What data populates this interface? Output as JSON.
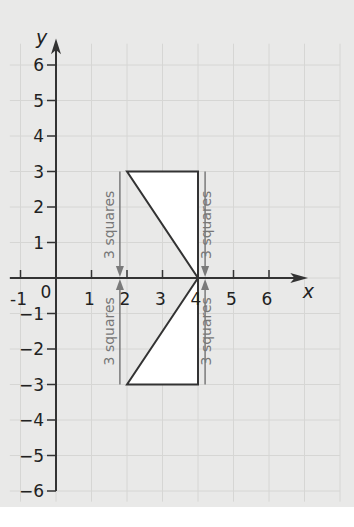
{
  "diagram": {
    "title": "",
    "x_axis": {
      "label": "x",
      "min": -1,
      "max": 6,
      "ticks": [
        -1,
        0,
        1,
        2,
        3,
        4,
        5,
        6
      ],
      "tick_labels": [
        "-1",
        "0",
        "1",
        "2",
        "3",
        "4",
        "5",
        "6"
      ]
    },
    "y_axis": {
      "label": "y",
      "min": -6,
      "max": 6,
      "ticks": [
        -6,
        -5,
        -4,
        -3,
        -2,
        -1,
        1,
        2,
        3,
        4,
        5,
        6
      ],
      "tick_labels": [
        "−6",
        "−5",
        "−4",
        "−3",
        "−2",
        "−1",
        "1",
        "2",
        "3",
        "4",
        "5",
        "6"
      ]
    },
    "shapes": [
      {
        "name": "triangle-upper",
        "vertices": [
          [
            2,
            3
          ],
          [
            4,
            3
          ],
          [
            4,
            0
          ]
        ],
        "fill": "#ffffff",
        "stroke": "#333333"
      },
      {
        "name": "triangle-lower",
        "vertices": [
          [
            2,
            -3
          ],
          [
            4,
            -3
          ],
          [
            4,
            0
          ]
        ],
        "fill": "#ffffff",
        "stroke": "#333333"
      }
    ],
    "measures": [
      {
        "name": "measure-left-upper",
        "x": 1.8,
        "from": 3,
        "to": 0,
        "label": "3 squares"
      },
      {
        "name": "measure-right-upper",
        "x": 4.2,
        "from": 3,
        "to": 0,
        "label": "3 squares"
      },
      {
        "name": "measure-left-lower",
        "x": 1.8,
        "from": -3,
        "to": 0,
        "label": "3 squares"
      },
      {
        "name": "measure-right-lower",
        "x": 4.2,
        "from": -3,
        "to": 0,
        "label": "3 squares"
      }
    ],
    "colors": {
      "axis": "#333333",
      "grid": "#d6d6d4",
      "measure": "#7a7a7a",
      "background": "#e9e9e8"
    }
  }
}
